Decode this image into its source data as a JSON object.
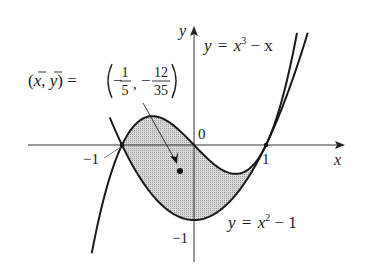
{
  "figure": {
    "type": "region-between-curves",
    "colors": {
      "curve": "#1a1a1a",
      "shade": "#cfcfcf",
      "axis": "#333333"
    },
    "axes": {
      "x_label": "x",
      "y_label": "y",
      "origin_label": "0",
      "x_ticks": [
        {
          "value": -1,
          "label": "−1"
        },
        {
          "value": 1,
          "label": "1"
        }
      ],
      "y_ticks": [
        {
          "value": -1,
          "label": "−1"
        }
      ]
    },
    "curves": [
      {
        "name": "cubic",
        "label_y": "y",
        "label_eq": "=",
        "label_base": "x",
        "label_exp": "3",
        "label_rest": " − x",
        "equation": "y = x^3 − x"
      },
      {
        "name": "parabola",
        "label_y": "y",
        "label_eq": "=",
        "label_base": "x",
        "label_exp": "2",
        "label_rest": " − 1",
        "equation": "y = x^2 − 1"
      }
    ],
    "intersections": [
      {
        "x": -1,
        "y": 0
      },
      {
        "x": 1,
        "y": 0
      }
    ],
    "centroid": {
      "label_lhs": "(x̄, ȳ) =",
      "x_num": "1",
      "x_den": "5",
      "x_sign": "−",
      "y_num": "12",
      "y_den": "35",
      "y_sign": "−",
      "x": -0.2,
      "y": -0.342857
    }
  }
}
